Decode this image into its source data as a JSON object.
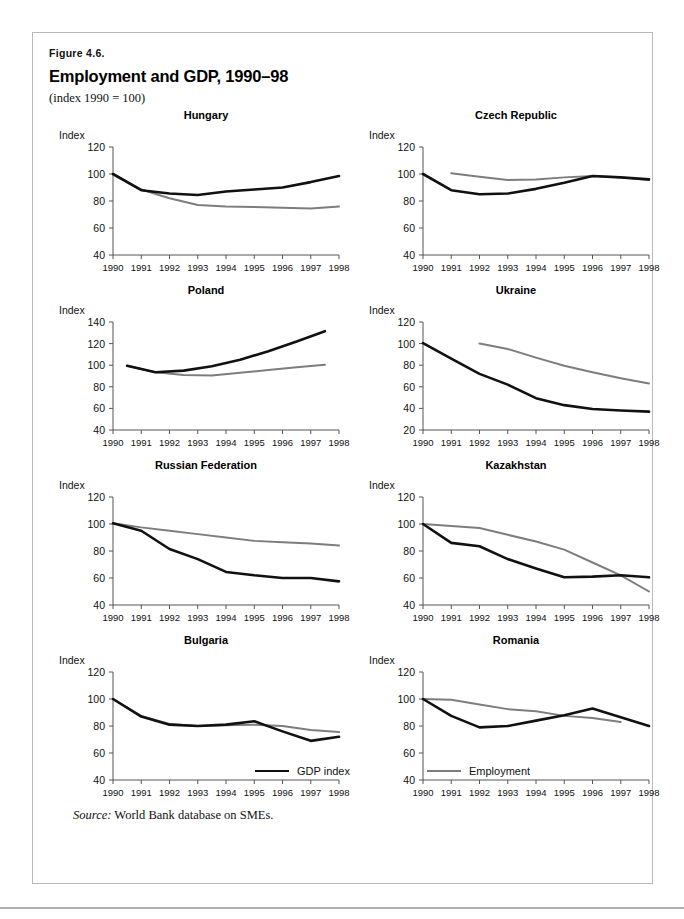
{
  "figure": {
    "number_label": "Figure 4.6.",
    "title": "Employment and GDP, 1990–98",
    "subtitle": "(index 1990 = 100)",
    "source_prefix": "Source:",
    "source_text": "World Bank database on SMEs.",
    "axis_name": "Index",
    "colors": {
      "gdp": "#111111",
      "employment": "#7d7d7d",
      "axis": "#555555",
      "frame": "#b9b9b9"
    }
  },
  "legend": {
    "items": [
      {
        "label": "GDP index",
        "series": "gdp",
        "color": "#111111"
      },
      {
        "label": "Employment",
        "series": "employment",
        "color": "#7d7d7d"
      }
    ]
  },
  "chart_data": [
    {
      "type": "line",
      "title": "Hungary",
      "xlabel": "",
      "ylabel": "Index",
      "x": [
        1990,
        1991,
        1992,
        1993,
        1994,
        1995,
        1996,
        1997,
        1998
      ],
      "xticklabels": [
        "1990",
        "1991",
        "1992",
        "1993",
        "1994",
        "1995",
        "1996",
        "1997",
        "1998"
      ],
      "xlim": [
        1990,
        1998
      ],
      "ylim": [
        40,
        120
      ],
      "yticks": [
        40,
        60,
        80,
        100,
        120
      ],
      "grid": false,
      "series": [
        {
          "name": "GDP index",
          "color": "#111111",
          "x": [
            1990,
            1991,
            1992,
            1993,
            1994,
            1995,
            1996,
            1997,
            1998
          ],
          "values": [
            100,
            88,
            85.5,
            84.5,
            87,
            88.5,
            90,
            94,
            98.5
          ]
        },
        {
          "name": "Employment",
          "color": "#7d7d7d",
          "x": [
            1990,
            1991,
            1992,
            1993,
            1994,
            1995,
            1996,
            1997,
            1998
          ],
          "values": [
            100,
            88.5,
            82,
            77,
            76,
            75.5,
            75,
            74.5,
            76
          ]
        }
      ]
    },
    {
      "type": "line",
      "title": "Czech Republic",
      "xlabel": "",
      "ylabel": "Index",
      "x": [
        1990,
        1991,
        1992,
        1993,
        1994,
        1995,
        1996,
        1997,
        1998
      ],
      "xticklabels": [
        "1990",
        "1991",
        "1992",
        "1993",
        "1994",
        "1995",
        "1996",
        "1997",
        "1998"
      ],
      "xlim": [
        1990,
        1998
      ],
      "ylim": [
        40,
        120
      ],
      "yticks": [
        40,
        60,
        80,
        100,
        120
      ],
      "grid": false,
      "series": [
        {
          "name": "GDP index",
          "color": "#111111",
          "x": [
            1990,
            1991,
            1992,
            1993,
            1994,
            1995,
            1996,
            1997,
            1998
          ],
          "values": [
            100,
            88,
            85,
            85.5,
            89,
            93.5,
            98.5,
            97.5,
            96
          ]
        },
        {
          "name": "Employment",
          "color": "#7d7d7d",
          "x": [
            1991,
            1992,
            1993,
            1994,
            1995,
            1996,
            1997,
            1998
          ],
          "values": [
            100.5,
            98,
            95.5,
            96,
            97.5,
            98.5,
            97.5,
            95.5
          ]
        }
      ]
    },
    {
      "type": "line",
      "title": "Poland",
      "xlabel": "",
      "ylabel": "Index",
      "x": [
        1990,
        1991,
        1992,
        1993,
        1994,
        1995,
        1996,
        1997,
        1998
      ],
      "xticklabels": [
        "1990",
        "1991",
        "1992",
        "1993",
        "1994",
        "1995",
        "1996",
        "1997",
        "1998"
      ],
      "xlim": [
        1990,
        1998
      ],
      "ylim": [
        40,
        140
      ],
      "yticks": [
        40,
        60,
        80,
        100,
        120,
        140
      ],
      "grid": false,
      "series": [
        {
          "name": "GDP index",
          "color": "#111111",
          "x": [
            1990.5,
            1991.5,
            1992.5,
            1993.5,
            1994.5,
            1995.5,
            1996.5,
            1997.5
          ],
          "values": [
            99.5,
            93.5,
            95,
            99,
            105,
            113,
            122,
            131.5
          ]
        },
        {
          "name": "Employment",
          "color": "#7d7d7d",
          "x": [
            1990.5,
            1991.5,
            1992.5,
            1993.5,
            1994.5,
            1995.5,
            1996.5,
            1997.5
          ],
          "values": [
            99.5,
            93.5,
            91,
            90.5,
            93,
            95.5,
            98,
            100.5
          ]
        }
      ]
    },
    {
      "type": "line",
      "title": "Ukraine",
      "xlabel": "",
      "ylabel": "Index",
      "x": [
        1990,
        1991,
        1992,
        1993,
        1994,
        1995,
        1996,
        1997,
        1998
      ],
      "xticklabels": [
        "1990",
        "1991",
        "1992",
        "1993",
        "1994",
        "1995",
        "1996",
        "1997",
        "1998"
      ],
      "xlim": [
        1990,
        1998
      ],
      "ylim": [
        20,
        120
      ],
      "yticks": [
        20,
        40,
        60,
        80,
        100,
        120
      ],
      "grid": false,
      "series": [
        {
          "name": "GDP index",
          "color": "#111111",
          "x": [
            1990,
            1991,
            1992,
            1993,
            1994,
            1995,
            1996,
            1997,
            1998
          ],
          "values": [
            100.5,
            86,
            72,
            62,
            49.5,
            43,
            39.5,
            38,
            37
          ]
        },
        {
          "name": "Employment",
          "color": "#7d7d7d",
          "x": [
            1992,
            1993,
            1994,
            1995,
            1996,
            1997,
            1998
          ],
          "values": [
            100,
            95,
            87,
            79.5,
            73.5,
            68,
            63
          ]
        }
      ]
    },
    {
      "type": "line",
      "title": "Russian Federation",
      "xlabel": "",
      "ylabel": "Index",
      "x": [
        1990,
        1991,
        1992,
        1993,
        1994,
        1995,
        1996,
        1997,
        1998
      ],
      "xticklabels": [
        "1990",
        "1991",
        "1992",
        "1993",
        "1994",
        "1995",
        "1996",
        "1997",
        "1998"
      ],
      "xlim": [
        1990,
        1998
      ],
      "ylim": [
        40,
        120
      ],
      "yticks": [
        40,
        60,
        80,
        100,
        120
      ],
      "grid": false,
      "series": [
        {
          "name": "GDP index",
          "color": "#111111",
          "x": [
            1990,
            1991,
            1992,
            1993,
            1994,
            1995,
            1996,
            1997,
            1998
          ],
          "values": [
            100.5,
            95,
            81.5,
            74,
            64.5,
            62,
            60,
            60,
            57.5
          ]
        },
        {
          "name": "Employment",
          "color": "#7d7d7d",
          "x": [
            1990,
            1991,
            1992,
            1993,
            1994,
            1995,
            1996,
            1997,
            1998
          ],
          "values": [
            100.5,
            97.5,
            95,
            92.5,
            90,
            87.5,
            86.5,
            85.5,
            84
          ]
        }
      ]
    },
    {
      "type": "line",
      "title": "Kazakhstan",
      "xlabel": "",
      "ylabel": "Index",
      "x": [
        1990,
        1991,
        1992,
        1993,
        1994,
        1995,
        1996,
        1997,
        1998
      ],
      "xticklabels": [
        "1990",
        "1991",
        "1992",
        "1993",
        "1994",
        "1995",
        "1996",
        "1997",
        "1998"
      ],
      "xlim": [
        1990,
        1998
      ],
      "ylim": [
        40,
        120
      ],
      "yticks": [
        40,
        60,
        80,
        100,
        120
      ],
      "grid": false,
      "series": [
        {
          "name": "GDP index",
          "color": "#111111",
          "x": [
            1990,
            1991,
            1992,
            1993,
            1994,
            1995,
            1996,
            1997,
            1998
          ],
          "values": [
            100,
            86,
            83.5,
            74,
            67,
            60.5,
            61,
            62,
            60.5
          ]
        },
        {
          "name": "Employment",
          "color": "#7d7d7d",
          "x": [
            1990,
            1991,
            1992,
            1993,
            1994,
            1995,
            1996,
            1997,
            1998
          ],
          "values": [
            100,
            98.5,
            97,
            92,
            87,
            81,
            71.5,
            62,
            50
          ]
        }
      ]
    },
    {
      "type": "line",
      "title": "Bulgaria",
      "xlabel": "",
      "ylabel": "Index",
      "x": [
        1990,
        1991,
        1992,
        1993,
        1994,
        1995,
        1996,
        1997,
        1998
      ],
      "xticklabels": [
        "1990",
        "1991",
        "1992",
        "1993",
        "1994",
        "1995",
        "1996",
        "1997",
        "1998"
      ],
      "xlim": [
        1990,
        1998
      ],
      "ylim": [
        40,
        120
      ],
      "yticks": [
        40,
        60,
        80,
        100,
        120
      ],
      "grid": false,
      "series": [
        {
          "name": "GDP index",
          "color": "#111111",
          "x": [
            1990,
            1991,
            1992,
            1993,
            1994,
            1995,
            1996,
            1997,
            1998
          ],
          "values": [
            100,
            87,
            81,
            80,
            81,
            83.5,
            76,
            69,
            72
          ]
        },
        {
          "name": "Employment",
          "color": "#7d7d7d",
          "x": [
            1990,
            1991,
            1992,
            1993,
            1994,
            1995,
            1996,
            1997,
            1998
          ],
          "values": [
            100,
            87.5,
            81.5,
            80,
            80.5,
            81,
            80,
            77,
            75.5
          ]
        }
      ]
    },
    {
      "type": "line",
      "title": "Romania",
      "xlabel": "",
      "ylabel": "Index",
      "x": [
        1990,
        1991,
        1992,
        1993,
        1994,
        1995,
        1996,
        1997,
        1998
      ],
      "xticklabels": [
        "1990",
        "1991",
        "1992",
        "1993",
        "1994",
        "1995",
        "1996",
        "1997",
        "1998"
      ],
      "xlim": [
        1990,
        1998
      ],
      "ylim": [
        40,
        120
      ],
      "yticks": [
        40,
        60,
        80,
        100,
        120
      ],
      "grid": false,
      "series": [
        {
          "name": "GDP index",
          "color": "#111111",
          "x": [
            1990,
            1991,
            1992,
            1993,
            1994,
            1995,
            1996,
            1997,
            1998
          ],
          "values": [
            100,
            87.5,
            79,
            80,
            84,
            88,
            93,
            86.5,
            80
          ]
        },
        {
          "name": "Employment",
          "color": "#7d7d7d",
          "x": [
            1990,
            1991,
            1992,
            1993,
            1994,
            1995,
            1996,
            1997
          ],
          "values": [
            100,
            99.5,
            96,
            92.5,
            91,
            87.5,
            86,
            83
          ]
        }
      ]
    }
  ]
}
